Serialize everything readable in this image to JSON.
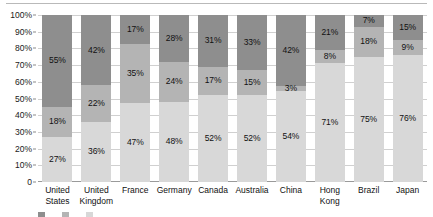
{
  "chart_data": {
    "type": "bar",
    "stacked": true,
    "stack_mode": "percent",
    "title": "",
    "subtitle": "",
    "xlabel": "",
    "ylabel": "",
    "ylim": [
      0,
      100
    ],
    "grid": true,
    "legend_position": "bottom",
    "value_suffix": "%",
    "categories": [
      "United States",
      "United Kingdom",
      "France",
      "Germany",
      "Canada",
      "Australia",
      "China",
      "Hong Kong",
      "Brazil",
      "Japan"
    ],
    "category_lines": [
      [
        "United",
        "States"
      ],
      [
        "United",
        "Kingdom"
      ],
      [
        "France"
      ],
      [
        "Germany"
      ],
      [
        "Canada"
      ],
      [
        "Australia"
      ],
      [
        "China"
      ],
      [
        "Hong",
        "Kong"
      ],
      [
        "Brazil"
      ],
      [
        "Japan"
      ]
    ],
    "ticks": [
      "100%",
      "90%",
      "80%",
      "70%",
      "60%",
      "50%",
      "40%",
      "30%",
      "20%",
      "10%",
      "0"
    ],
    "tick_values": [
      100,
      90,
      80,
      70,
      60,
      50,
      40,
      30,
      20,
      10,
      0
    ],
    "series": [
      {
        "name": "series-top",
        "color": "#8e8e8e",
        "values": [
          55,
          42,
          17,
          28,
          31,
          33,
          42,
          21,
          7,
          15
        ],
        "labels": [
          "55%",
          "42%",
          "17%",
          "28%",
          "31%",
          "33%",
          "42%",
          "21%",
          "7%",
          "15%"
        ]
      },
      {
        "name": "series-middle",
        "color": "#b4b4b4",
        "values": [
          18,
          22,
          35,
          24,
          17,
          15,
          3,
          8,
          18,
          9
        ],
        "labels": [
          "18%",
          "22%",
          "35%",
          "24%",
          "17%",
          "15%",
          "3%",
          "8%",
          "18%",
          "9%"
        ]
      },
      {
        "name": "series-bottom",
        "color": "#d8d8d8",
        "values": [
          27,
          36,
          47,
          48,
          52,
          52,
          54,
          71,
          75,
          76
        ],
        "labels": [
          "27%",
          "36%",
          "47%",
          "48%",
          "52%",
          "52%",
          "54%",
          "71%",
          "75%",
          "76%"
        ]
      }
    ]
  },
  "colors": {
    "series_top": "#8e8e8e",
    "series_middle": "#b4b4b4",
    "series_bottom": "#d8d8d8",
    "gridline": "#d0d0d0",
    "axis": "#9a9a9a",
    "text": "#111111",
    "background": "#ffffff"
  }
}
